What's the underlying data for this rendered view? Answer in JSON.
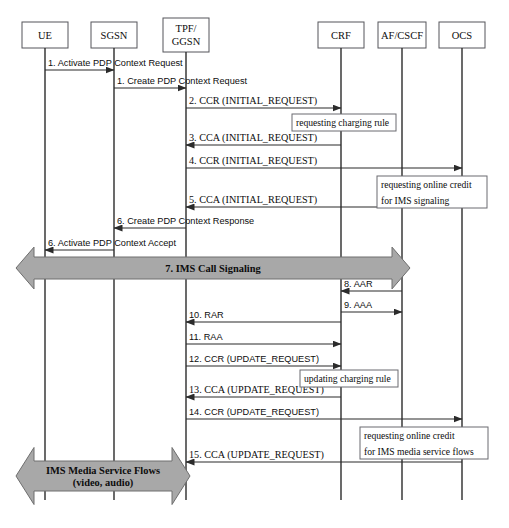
{
  "diagram": {
    "type": "uml-sequence-diagram",
    "width": 509,
    "height": 528,
    "colors": {
      "background": "#ffffff",
      "line": "#2b2b2b",
      "box_stroke": "#55555a",
      "band_fill": "#a8a8a8",
      "band_stroke": "#6e6e6e",
      "note_stroke": "#6b6b70",
      "text": "#0d0d0d"
    }
  },
  "lifelines": [
    {
      "id": "ue",
      "label": "UE",
      "label2": "",
      "cx": 45,
      "box_x": 22,
      "box_y": 22,
      "box_w": 46,
      "box_h": 26,
      "bottom": 500
    },
    {
      "id": "sgsn",
      "label": "SGSN",
      "label2": "",
      "cx": 114,
      "box_x": 91,
      "box_y": 22,
      "box_w": 46,
      "box_h": 26,
      "bottom": 500
    },
    {
      "id": "ggsn",
      "label": "TPF/",
      "label2": "GGSN",
      "cx": 186,
      "box_x": 163,
      "box_y": 18,
      "box_w": 46,
      "box_h": 34,
      "bottom": 500
    },
    {
      "id": "crf",
      "label": "CRF",
      "label2": "",
      "cx": 341,
      "box_x": 318,
      "box_y": 22,
      "box_w": 46,
      "box_h": 26,
      "bottom": 500
    },
    {
      "id": "af",
      "label": "AF/CSCF",
      "label2": "",
      "cx": 402,
      "box_x": 378,
      "box_y": 22,
      "box_w": 48,
      "box_h": 26,
      "bottom": 500
    },
    {
      "id": "ocs",
      "label": "OCS",
      "label2": "",
      "cx": 462,
      "box_x": 439,
      "box_y": 22,
      "box_w": 46,
      "box_h": 26,
      "bottom": 500
    }
  ],
  "messages": [
    {
      "num": "1",
      "label": "1. Activate PDP Context Request",
      "from": "ue",
      "to": "sgsn",
      "y": 70,
      "dir": "right",
      "font": "sans",
      "text_x": 48,
      "text_y": 66
    },
    {
      "num": "1b",
      "label": "1. Create PDP Context Request",
      "from": "sgsn",
      "to": "ggsn",
      "y": 88,
      "dir": "right",
      "font": "sans",
      "text_x": 117,
      "text_y": 84
    },
    {
      "num": "2",
      "label": "2. CCR (INITIAL_REQUEST)",
      "from": "ggsn",
      "to": "crf",
      "y": 108,
      "dir": "right",
      "font": "serif",
      "text_x": 189,
      "text_y": 104
    },
    {
      "num": "3",
      "label": "3. CCA (INITIAL_REQUEST)",
      "from": "crf",
      "to": "ggsn",
      "y": 145,
      "dir": "left",
      "font": "serif",
      "text_x": 189,
      "text_y": 141
    },
    {
      "num": "4",
      "label": "4. CCR (INITIAL_REQUEST)",
      "from": "ggsn",
      "to": "ocs",
      "y": 168,
      "dir": "right",
      "font": "serif",
      "text_x": 189,
      "text_y": 164
    },
    {
      "num": "5",
      "label": "5. CCA (INITIAL_REQUEST)",
      "from": "ocs",
      "to": "ggsn",
      "y": 207,
      "dir": "left",
      "font": "serif",
      "text_x": 189,
      "text_y": 203
    },
    {
      "num": "6",
      "label": "6. Create PDP Context Response",
      "from": "ggsn",
      "to": "sgsn",
      "y": 228,
      "dir": "left",
      "font": "sans",
      "text_x": 117,
      "text_y": 224
    },
    {
      "num": "6b",
      "label": "6. Activate PDP Context Accept",
      "from": "sgsn",
      "to": "ue",
      "y": 250,
      "dir": "left",
      "font": "sans",
      "text_x": 48,
      "text_y": 246
    },
    {
      "num": "8",
      "label": "8. AAR",
      "from": "af",
      "to": "crf",
      "y": 291,
      "dir": "left",
      "font": "sans",
      "text_x": 344,
      "text_y": 287
    },
    {
      "num": "9",
      "label": "9. AAA",
      "from": "crf",
      "to": "af",
      "y": 312,
      "dir": "right",
      "font": "sans",
      "text_x": 344,
      "text_y": 308
    },
    {
      "num": "10",
      "label": "10. RAR",
      "from": "crf",
      "to": "ggsn",
      "y": 322,
      "dir": "left",
      "font": "sans",
      "text_x": 189,
      "text_y": 318
    },
    {
      "num": "11",
      "label": "11. RAA",
      "from": "ggsn",
      "to": "crf",
      "y": 344,
      "dir": "right",
      "font": "sans",
      "text_x": 189,
      "text_y": 340
    },
    {
      "num": "12",
      "label": "12. CCR (UPDATE_REQUEST)",
      "from": "ggsn",
      "to": "crf",
      "y": 366,
      "dir": "right",
      "font": "sans",
      "text_x": 189,
      "text_y": 362
    },
    {
      "num": "13",
      "label": "13. CCA (UPDATE_REQUEST)",
      "from": "crf",
      "to": "ggsn",
      "y": 397,
      "dir": "left",
      "font": "serif",
      "text_x": 189,
      "text_y": 393
    },
    {
      "num": "14",
      "label": "14. CCR (UPDATE_REQUEST)",
      "from": "ggsn",
      "to": "ocs",
      "y": 419,
      "dir": "right",
      "font": "sans",
      "text_x": 189,
      "text_y": 415
    },
    {
      "num": "15",
      "label": "15. CCA (UPDATE_REQUEST)",
      "from": "ocs",
      "to": "ggsn",
      "y": 462,
      "dir": "left",
      "font": "serif",
      "text_x": 189,
      "text_y": 458
    }
  ],
  "notes": [
    {
      "id": "note-charging-rule",
      "lines": [
        "requesting charging rule"
      ],
      "x": 292,
      "y": 114,
      "w": 104,
      "h": 17
    },
    {
      "id": "note-online-credit",
      "lines": [
        "requesting online credit",
        "for IMS signaling"
      ],
      "x": 377,
      "y": 176,
      "w": 110,
      "h": 32
    },
    {
      "id": "note-updating-rule",
      "lines": [
        "updating charging rule"
      ],
      "x": 300,
      "y": 370,
      "w": 98,
      "h": 17
    },
    {
      "id": "note-media-credit",
      "lines": [
        "requesting online credit",
        "for IMS media service flows"
      ],
      "x": 360,
      "y": 427,
      "w": 128,
      "h": 32
    }
  ],
  "bands": [
    {
      "id": "band-ims-call-signaling",
      "lines": [
        "7. IMS Call Signaling"
      ],
      "x1": 16,
      "x2": 410,
      "cy": 268,
      "h": 22,
      "head": 18,
      "arrow_left": true,
      "arrow_right": true
    },
    {
      "id": "band-ims-media-flows",
      "lines": [
        "IMS Media Service Flows",
        "(video, audio)"
      ],
      "x1": 16,
      "x2": 190,
      "cy": 476,
      "h": 30,
      "head": 18,
      "arrow_left": true,
      "arrow_right": true
    }
  ]
}
